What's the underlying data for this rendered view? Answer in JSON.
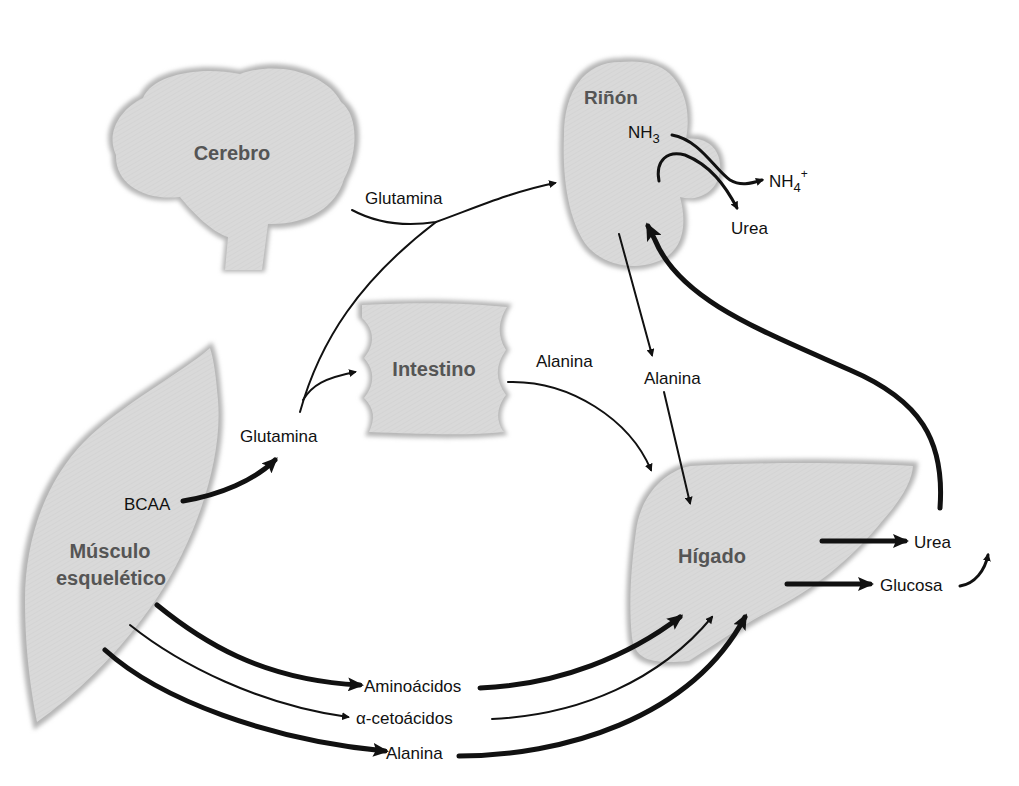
{
  "colors": {
    "organ_fill": "#d9d9d9",
    "organ_edge": "#a8a8a8",
    "organ_label": "#555555",
    "arrow": "#111111",
    "text": "#111111"
  },
  "organs": {
    "brain": {
      "label": "Cerebro"
    },
    "kidney": {
      "label": "Riñón"
    },
    "intestine": {
      "label": "Intestino"
    },
    "muscle": {
      "label_line1": "Músculo",
      "label_line2": "esquelético"
    },
    "liver": {
      "label": "Hígado"
    }
  },
  "kidney_labels": {
    "nh3": "NH",
    "nh3_sub": "3",
    "nh4": "NH",
    "nh4_sub": "4",
    "nh4_sup": "+",
    "urea": "Urea"
  },
  "flows": {
    "brain_glutamine": "Glutamina",
    "muscle_glutamine": "Glutamina",
    "bcaa": "BCAA",
    "intestine_alanine": "Alanina",
    "kidney_alanine": "Alanina",
    "liver_urea": "Urea",
    "liver_glucose": "Glucosa",
    "aminoacids": "Aminoácidos",
    "ketoacids": "α-cetoácidos",
    "alanine": "Alanina"
  }
}
